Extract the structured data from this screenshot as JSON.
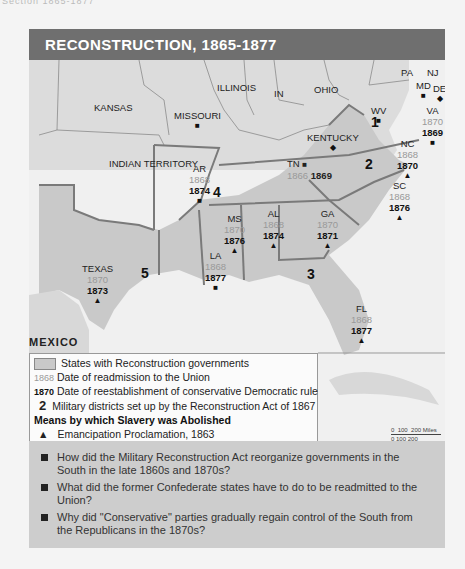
{
  "page_header_cut": "Section 1865-1877",
  "title": "RECONSTRUCTION, 1865-1877",
  "map": {
    "regions": [
      {
        "name": "KANSAS"
      },
      {
        "name": "MISSOURI",
        "symbol": "square"
      },
      {
        "name": "ILLINOIS"
      },
      {
        "name": "IN"
      },
      {
        "name": "OHIO"
      },
      {
        "name": "PA"
      },
      {
        "name": "NJ"
      },
      {
        "name": "MD",
        "symbol": "square"
      },
      {
        "name": "DE",
        "symbol": "diamond"
      },
      {
        "name": "WV",
        "symbol": "square"
      },
      {
        "name": "KENTUCKY",
        "symbol": "diamond"
      },
      {
        "name": "INDIAN TERRITORY"
      },
      {
        "name": "MEXICO"
      }
    ],
    "states": [
      {
        "name": "VA",
        "readmitted": "1870",
        "conservative": "1869",
        "symbol": "square"
      },
      {
        "name": "NC",
        "readmitted": "1868",
        "conservative": "1870",
        "symbol": "triangle"
      },
      {
        "name": "TN",
        "readmitted": "1866",
        "conservative": "1869",
        "symbol": "square"
      },
      {
        "name": "SC",
        "readmitted": "1868",
        "conservative": "1876",
        "symbol": "triangle"
      },
      {
        "name": "AR",
        "readmitted": "1868",
        "conservative": "1874",
        "symbol": "square"
      },
      {
        "name": "MS",
        "readmitted": "1870",
        "conservative": "1876",
        "symbol": "triangle"
      },
      {
        "name": "AL",
        "readmitted": "1868",
        "conservative": "1874",
        "symbol": "triangle"
      },
      {
        "name": "GA",
        "readmitted": "1870",
        "conservative": "1871",
        "symbol": "triangle"
      },
      {
        "name": "LA",
        "readmitted": "1868",
        "conservative": "1877",
        "symbol": "square"
      },
      {
        "name": "TEXAS",
        "readmitted": "1870",
        "conservative": "1873",
        "symbol": "triangle"
      },
      {
        "name": "FL",
        "readmitted": "1868",
        "conservative": "1877",
        "symbol": "triangle"
      }
    ],
    "districts": [
      "1",
      "2",
      "3",
      "4",
      "5"
    ],
    "scale": {
      "miles": [
        "0",
        "100",
        "200 Miles"
      ],
      "km": [
        "0",
        "100",
        "200 Kilometers"
      ]
    }
  },
  "legend": {
    "reconstruction_states": "States with Reconstruction governments",
    "readmission_year": "1868",
    "readmission_label": "Date of readmission to the Union",
    "conservative_year": "1870",
    "conservative_label": "Date of reestablishment of conservative Democratic rule",
    "district_num": "2",
    "district_label": "Military districts set up by the Reconstruction Act of 1867",
    "means_title": "Means by which Slavery was Abolished",
    "means": [
      {
        "symbol": "▲",
        "label": "Emancipation Proclamation, 1863"
      },
      {
        "symbol": "■",
        "label": "State action"
      },
      {
        "symbol": "◆",
        "label": "Thirteenth Amendment, 1865"
      }
    ]
  },
  "questions": [
    "How did the Military Reconstruction Act reorganize governments in the South in the late 1860s and 1870s?",
    "What did the former Confederate states have to do to be readmitted to the Union?",
    "Why did \"Conservative\" parties gradually regain control of the South from the Republicans in the 1870s?"
  ],
  "colors": {
    "header": "#6f6f6f",
    "reconstruction_fill": "#c9c9c9",
    "other_land": "#dcdcdc",
    "water": "#efefef",
    "question_box": "#cdcdcd"
  }
}
